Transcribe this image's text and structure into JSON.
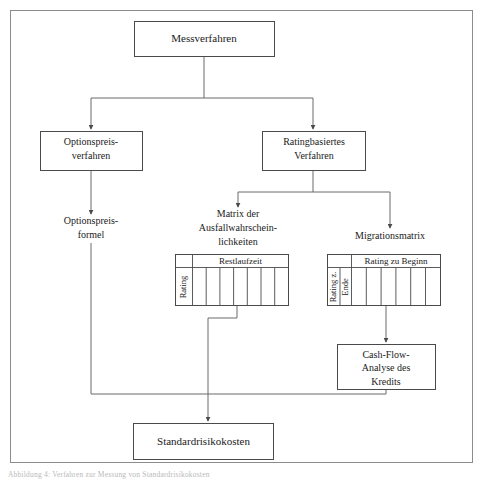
{
  "figure": {
    "caption": "Abbildung 4: Verfahren zur Messung von Standardrisikokosten",
    "frame_color": "#8c8c8c",
    "line_color": "#6b6b6b",
    "box_border_color": "#4a4a4a",
    "background": "#ffffff",
    "text_color": "#1a1a1a"
  },
  "nodes": {
    "messverfahren": {
      "label": "Messverfahren",
      "x": 134,
      "y": 21,
      "w": 140,
      "h": 35
    },
    "optionspreisverfahren": {
      "line1": "Optionspreis-",
      "line2": "verfahren",
      "x": 40,
      "y": 131,
      "w": 102,
      "h": 39
    },
    "ratingbasiertes": {
      "line1": "Ratingbasiertes",
      "line2": "Verfahren",
      "x": 262,
      "y": 131,
      "w": 103,
      "h": 39
    },
    "optionspreisformel": {
      "line1": "Optionspreis-",
      "line2": "formel",
      "cx": 91,
      "cy": 228
    },
    "matrix_ausfall": {
      "line1": "Matrix der",
      "line2": "Ausfallwahrschein-",
      "line3": "lichkeiten",
      "cx": 238,
      "cy": 222
    },
    "migrationsmatrix": {
      "label": "Migrationsmatrix",
      "cx": 390,
      "cy": 236
    },
    "cashflow": {
      "line1": "Cash-Flow-",
      "line2": "Analyse des",
      "line3": "Kredits",
      "x": 337,
      "y": 344,
      "w": 98,
      "h": 45
    },
    "standardrisikokosten": {
      "label": "Standardrisikokosten",
      "x": 133,
      "y": 423,
      "w": 140,
      "h": 36
    }
  },
  "tables": {
    "ausfall_matrix": {
      "header": "Restlaufzeit",
      "row_label": "Rating",
      "x": 175,
      "y": 254,
      "w": 113,
      "h": 51,
      "header_h": 13,
      "label_col_w": 17,
      "data_cols": 7
    },
    "migration_matrix": {
      "header": "Rating zu Beginn",
      "row_label_line1": "Rating z.",
      "row_label_line2": "Ende",
      "x": 327,
      "y": 254,
      "w": 113,
      "h": 51,
      "header_h": 13,
      "label_col_w": 24,
      "data_cols": 6
    }
  },
  "connectors": [
    {
      "name": "messverfahren-trunk",
      "desc": "Messverfahren down to split bar"
    },
    {
      "name": "split-to-optionspreisverfahren",
      "desc": "arrow into Optionspreisverfahren"
    },
    {
      "name": "split-to-ratingbasiertes",
      "desc": "arrow into Ratingbasiertes Verfahren"
    },
    {
      "name": "optionspreisverfahren-to-formel",
      "desc": "arrow into Optionspreisformel"
    },
    {
      "name": "ratingbasiertes-trunk",
      "desc": "Ratingbasiertes down to split bar"
    },
    {
      "name": "split-to-matrix",
      "desc": "arrow into Matrix der Ausfallwahrscheinlichkeiten"
    },
    {
      "name": "split-to-migrationsmatrix",
      "desc": "arrow into Migrationsmatrix"
    },
    {
      "name": "migration-to-cashflow",
      "desc": "arrow into Cash-Flow-Analyse des Kredits"
    },
    {
      "name": "ausfallmatrix-to-bus",
      "desc": "Ausfallmatrix down, jog left, into bus"
    },
    {
      "name": "formel-to-bus",
      "desc": "Optionspreisformel down into bus"
    },
    {
      "name": "cashflow-to-bus",
      "desc": "Cash-Flow box down into bus"
    },
    {
      "name": "bus-to-standardrisikokosten",
      "desc": "arrow into Standardrisikokosten"
    }
  ]
}
